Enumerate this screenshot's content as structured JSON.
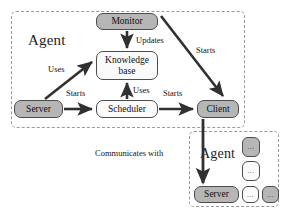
{
  "diagram": {
    "groups": [
      {
        "id": "agent-main",
        "label": "Agent"
      },
      {
        "id": "agent-remote",
        "label": "Agent"
      }
    ],
    "nodes": [
      {
        "id": "monitor",
        "label": "Monitor",
        "fill": "gray"
      },
      {
        "id": "knowledge",
        "label": "Knowledge\nbase",
        "fill": "white"
      },
      {
        "id": "server",
        "label": "Server",
        "fill": "gray"
      },
      {
        "id": "scheduler",
        "label": "Scheduler",
        "fill": "white"
      },
      {
        "id": "client",
        "label": "Client",
        "fill": "gray"
      },
      {
        "id": "remote-server",
        "label": "Server",
        "fill": "gray"
      }
    ],
    "placeholder_nodes": [
      {
        "id": "dots-a",
        "label": "...",
        "fill": "gray"
      },
      {
        "id": "dots-b",
        "label": "...",
        "fill": "white"
      },
      {
        "id": "dots-c",
        "label": "...",
        "fill": "white"
      },
      {
        "id": "dots-d",
        "label": "...",
        "fill": "gray"
      }
    ],
    "edges": [
      {
        "id": "monitor-knowledge",
        "from": "monitor",
        "to": "knowledge",
        "label": "Updates"
      },
      {
        "id": "monitor-client",
        "from": "monitor",
        "to": "client",
        "label": "Starts"
      },
      {
        "id": "server-knowledge",
        "from": "server",
        "to": "knowledge",
        "label": "Uses"
      },
      {
        "id": "server-scheduler",
        "from": "server",
        "to": "scheduler",
        "label": "Starts"
      },
      {
        "id": "scheduler-knowledge",
        "from": "scheduler",
        "to": "knowledge",
        "label": "Uses"
      },
      {
        "id": "scheduler-client",
        "from": "scheduler",
        "to": "client",
        "label": "Starts"
      },
      {
        "id": "client-remote-server",
        "from": "client",
        "to": "remote-server",
        "label": "Communicates with"
      }
    ],
    "colors": {
      "node_fill_gray": "#b6b6b6",
      "node_fill_white": "#fafafa",
      "node_stroke": "#4d4d4d",
      "group_stroke": "#9a9a9a",
      "arrow": "#303030",
      "background": "#ffffff"
    }
  }
}
